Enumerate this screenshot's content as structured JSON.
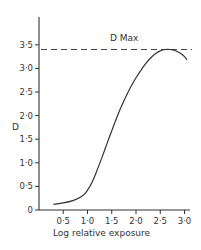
{
  "chart_data": {
    "type": "line",
    "title": "",
    "xlabel": "Log relative exposure",
    "ylabel": "D",
    "xlim": [
      0,
      3.1
    ],
    "ylim": [
      0,
      3.9
    ],
    "grid": false,
    "legend": null,
    "x_ticks": [
      "0·5",
      "1·0",
      "1·5",
      "2·0",
      "2·5",
      "3·0"
    ],
    "y_ticks": [
      "0",
      "0·5",
      "1·0",
      "1·5",
      "2·0",
      "2·5",
      "3·0",
      "3·5"
    ],
    "series": [
      {
        "name": "Characteristic curve",
        "x": [
          0.3,
          0.5,
          0.7,
          0.9,
          1.0,
          1.1,
          1.2,
          1.3,
          1.4,
          1.5,
          1.6,
          1.7,
          1.8,
          1.9,
          2.0,
          2.1,
          2.2,
          2.3,
          2.4,
          2.5,
          2.6,
          2.7,
          2.8,
          2.9,
          3.0,
          3.05
        ],
        "values": [
          0.12,
          0.15,
          0.2,
          0.3,
          0.42,
          0.6,
          0.85,
          1.12,
          1.4,
          1.68,
          1.95,
          2.2,
          2.42,
          2.62,
          2.8,
          2.96,
          3.1,
          3.22,
          3.31,
          3.37,
          3.4,
          3.4,
          3.38,
          3.33,
          3.25,
          3.18
        ]
      }
    ],
    "annotations": [
      {
        "text": "D Max",
        "type": "dashed-horizontal-line",
        "y": 3.4
      }
    ]
  },
  "labels": {
    "x_axis": "Log relative exposure",
    "y_axis": "D",
    "dmax": "D Max"
  }
}
